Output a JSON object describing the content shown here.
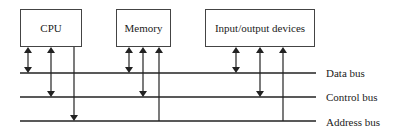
{
  "diagram": {
    "type": "system-bus-architecture",
    "components": [
      {
        "id": "cpu",
        "label": "CPU"
      },
      {
        "id": "memory",
        "label": "Memory"
      },
      {
        "id": "io",
        "label": "Input/output devices"
      }
    ],
    "buses": [
      {
        "id": "data",
        "label": "Data bus"
      },
      {
        "id": "control",
        "label": "Control bus"
      },
      {
        "id": "address",
        "label": "Address bus"
      }
    ],
    "connections": [
      {
        "from": "cpu",
        "bus": "data",
        "direction": "bidirectional"
      },
      {
        "from": "cpu",
        "bus": "control",
        "direction": "bidirectional"
      },
      {
        "from": "cpu",
        "bus": "address",
        "direction": "to-bus"
      },
      {
        "from": "memory",
        "bus": "data",
        "direction": "bidirectional"
      },
      {
        "from": "memory",
        "bus": "control",
        "direction": "bidirectional"
      },
      {
        "from": "memory",
        "bus": "address",
        "direction": "from-bus"
      },
      {
        "from": "io",
        "bus": "data",
        "direction": "bidirectional"
      },
      {
        "from": "io",
        "bus": "control",
        "direction": "bidirectional"
      },
      {
        "from": "io",
        "bus": "address",
        "direction": "from-bus"
      }
    ],
    "colors": {
      "line": "#222222",
      "box_border": "#444444",
      "background": "#ffffff"
    }
  }
}
